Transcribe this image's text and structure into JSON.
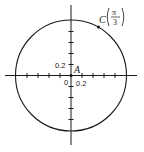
{
  "figure": {
    "type": "unit-circle-diagram",
    "axes": {
      "origin_label": "0",
      "x_tick_label": "0.2",
      "y_tick_label": "0.2",
      "tick_step": 0.2,
      "range": [
        -1.2,
        1.2
      ]
    },
    "circle": {
      "center": [
        0,
        0
      ],
      "radius": 1
    },
    "points": [
      {
        "name": "A",
        "label": "A",
        "coords": [
          0,
          0
        ]
      },
      {
        "name": "C",
        "label": "C",
        "angle_numerator": "π",
        "angle_denominator": "3",
        "coords": [
          0.5,
          0.866
        ]
      }
    ],
    "colors": {
      "stroke": "#1a1a1a",
      "background": "#ffffff"
    }
  }
}
